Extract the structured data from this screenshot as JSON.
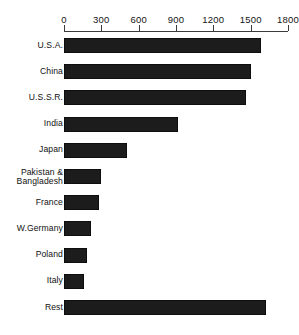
{
  "chart_data": {
    "type": "bar",
    "orientation": "horizontal",
    "title": "",
    "xlabel": "",
    "ylabel": "",
    "xlim": [
      0,
      1800
    ],
    "grid": false,
    "legend": null,
    "ticks": [
      {
        "label": "0",
        "value": 0
      },
      {
        "label": "300",
        "value": 300
      },
      {
        "label": "600",
        "value": 600
      },
      {
        "label": "900",
        "value": 900
      },
      {
        "label": "1200",
        "value": 1200
      },
      {
        "label": "1500",
        "value": 1500
      },
      {
        "label": "1800",
        "value": 1800
      }
    ],
    "categories": [
      "U.S.A.",
      "China",
      "U.S.S.R.",
      "India",
      "Japan",
      "Pakistan &\nBangladesh",
      "France",
      "W.Germany",
      "Poland",
      "Italy",
      "Rest"
    ],
    "values": [
      1580,
      1500,
      1460,
      920,
      510,
      300,
      280,
      215,
      185,
      160,
      1620
    ],
    "bar_color": "#1c1c1c",
    "axis_color": "#3a3a3a"
  },
  "caption": {
    "text": ""
  }
}
